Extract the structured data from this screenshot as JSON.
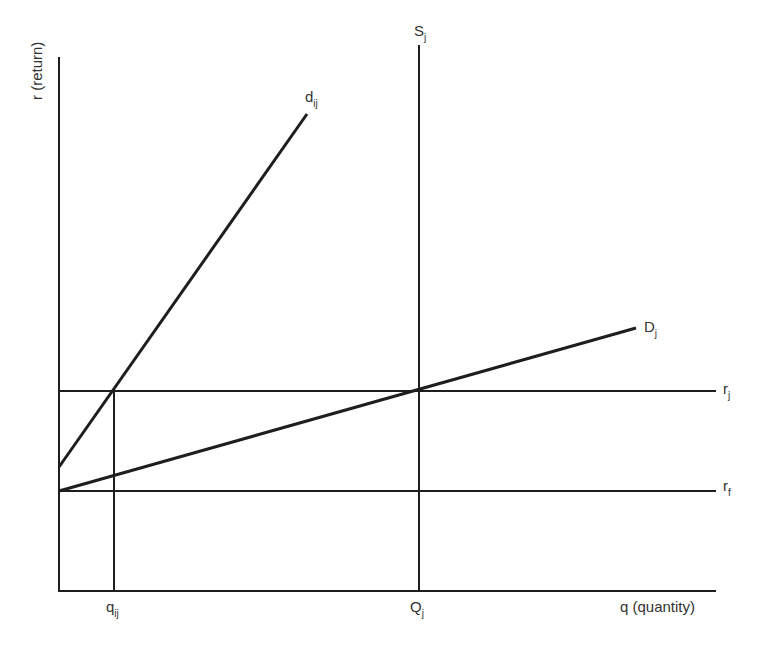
{
  "diagram": {
    "axes": {
      "y_label": "r (return)",
      "x_label": "q (quantity)"
    },
    "curves": {
      "d_ij": {
        "main": "d",
        "sub": "ij"
      },
      "S_j": {
        "main": "S",
        "sub": "j"
      },
      "D_j": {
        "main": "D",
        "sub": "j"
      }
    },
    "levels": {
      "r_j": {
        "main": "r",
        "sub": "j"
      },
      "r_f": {
        "main": "r",
        "sub": "f"
      }
    },
    "x_ticks": {
      "q_ij": {
        "main": "q",
        "sub": "ij"
      },
      "Q_j": {
        "main": "Q",
        "sub": "j"
      }
    },
    "colors": {
      "line": "#1e1e1e",
      "text": "#333333",
      "background": "#ffffff"
    }
  }
}
